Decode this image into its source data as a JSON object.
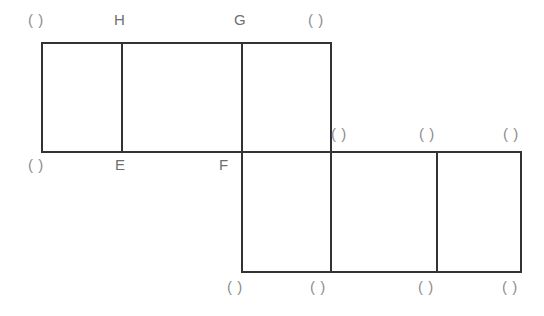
{
  "figure": {
    "background_color": "#ffffff",
    "stroke_color": "#333333",
    "stroke_width": 2,
    "label_color": "#8d8d8d",
    "named_label_color": "#6f6f6f",
    "blank_label": "( )",
    "geometry": {
      "top_row": {
        "x_left": 42,
        "x_right": 331,
        "y_top": 43,
        "y_bottom": 152,
        "dividers_x": [
          122,
          242
        ]
      },
      "bottom_row": {
        "x_left": 242,
        "x_right": 521,
        "y_top": 152,
        "y_bottom": 272,
        "dividers_x": [
          331,
          437
        ]
      },
      "shared_horizontal_y": 152,
      "shared_horizontal_x_start": 42,
      "shared_horizontal_x_end": 521
    },
    "segments": [
      {
        "name": "top-edge",
        "x1": 42,
        "y1": 43,
        "x2": 331,
        "y2": 43
      },
      {
        "name": "middle-horizontal-edge",
        "x1": 42,
        "y1": 152,
        "x2": 521,
        "y2": 152
      },
      {
        "name": "bottom-edge",
        "x1": 242,
        "y1": 272,
        "x2": 521,
        "y2": 272
      },
      {
        "name": "left-edge",
        "x1": 42,
        "y1": 43,
        "x2": 42,
        "y2": 152
      },
      {
        "name": "vertical-H",
        "x1": 122,
        "y1": 43,
        "x2": 122,
        "y2": 152
      },
      {
        "name": "vertical-G-F",
        "x1": 242,
        "y1": 43,
        "x2": 242,
        "y2": 272
      },
      {
        "name": "vertical-right-top",
        "x1": 331,
        "y1": 43,
        "x2": 331,
        "y2": 272
      },
      {
        "name": "vertical-bottom-inner",
        "x1": 437,
        "y1": 152,
        "x2": 437,
        "y2": 272
      },
      {
        "name": "right-edge-bottom",
        "x1": 521,
        "y1": 152,
        "x2": 521,
        "y2": 272
      }
    ],
    "labels": {
      "top": [
        {
          "id": "top-left-blank",
          "text": "( )",
          "x": 28,
          "y": 12,
          "named": false
        },
        {
          "id": "vertex-H",
          "text": "H",
          "x": 114,
          "y": 12,
          "named": true
        },
        {
          "id": "vertex-G",
          "text": "G",
          "x": 234,
          "y": 12,
          "named": true
        },
        {
          "id": "top-right-blank",
          "text": "( )",
          "x": 308,
          "y": 12,
          "named": false
        }
      ],
      "middle_left": [
        {
          "id": "middle-left-blank",
          "text": "( )",
          "x": 28,
          "y": 157,
          "named": false
        },
        {
          "id": "vertex-E",
          "text": "E",
          "x": 115,
          "y": 157,
          "named": true
        },
        {
          "id": "vertex-F",
          "text": "F",
          "x": 219,
          "y": 157,
          "named": true
        }
      ],
      "middle_right": [
        {
          "id": "middle-right-blank-1",
          "text": "( )",
          "x": 331,
          "y": 126,
          "named": false
        },
        {
          "id": "middle-right-blank-2",
          "text": "( )",
          "x": 419,
          "y": 126,
          "named": false
        },
        {
          "id": "middle-right-blank-3",
          "text": "( )",
          "x": 503,
          "y": 126,
          "named": false
        }
      ],
      "bottom": [
        {
          "id": "bottom-blank-1",
          "text": "( )",
          "x": 227,
          "y": 279,
          "named": false
        },
        {
          "id": "bottom-blank-2",
          "text": "( )",
          "x": 310,
          "y": 279,
          "named": false
        },
        {
          "id": "bottom-blank-3",
          "text": "( )",
          "x": 418,
          "y": 279,
          "named": false
        },
        {
          "id": "bottom-blank-4",
          "text": "( )",
          "x": 502,
          "y": 279,
          "named": false
        }
      ]
    }
  }
}
